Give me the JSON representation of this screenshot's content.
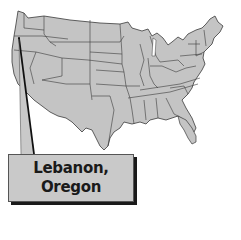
{
  "map": {
    "title": "United States (contiguous)",
    "fill_color": "#c4c4c4",
    "border_color": "#3a3a3a",
    "marker_location": "Oregon"
  },
  "callout": {
    "line1": "Lebanon,",
    "line2": "Oregon",
    "box_color": "#c9c9c9",
    "shadow_color": "#1a1a1a"
  }
}
